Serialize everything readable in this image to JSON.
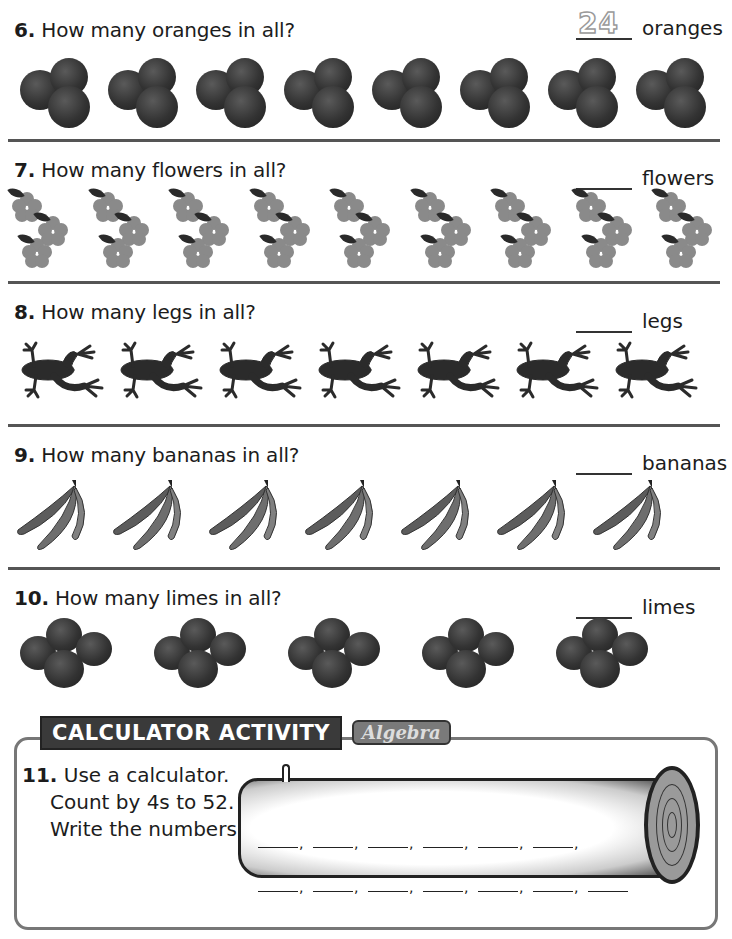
{
  "questions": [
    {
      "num": "6.",
      "text": "How many oranges in all?",
      "unit": "oranges",
      "answer_traced": "24",
      "item": "orange-group",
      "count": 8
    },
    {
      "num": "7.",
      "text": "How many flowers in all?",
      "unit": "flowers",
      "answer_traced": "",
      "item": "flower-group",
      "count": 9
    },
    {
      "num": "8.",
      "text": "How many legs in all?",
      "unit": "legs",
      "answer_traced": "",
      "item": "frog",
      "count": 7
    },
    {
      "num": "9.",
      "text": "How many bananas in all?",
      "unit": "bananas",
      "answer_traced": "",
      "item": "banana-bunch",
      "count": 7
    },
    {
      "num": "10.",
      "text": "How many limes in all?",
      "unit": "limes",
      "answer_traced": "",
      "item": "lime-group",
      "count": 5
    }
  ],
  "calculator_activity": {
    "header": "CALCULATOR ACTIVITY",
    "tag": "Algebra",
    "num": "11.",
    "lines": [
      "Use a calculator.",
      "Count by 4s to 52.",
      "Write the numbers."
    ],
    "row1_blanks": 6,
    "row2_blanks": 7
  },
  "colors": {
    "divider": "#555555",
    "text": "#1c1c1c",
    "header_bg": "#3a3a3a",
    "border": "#777777"
  }
}
